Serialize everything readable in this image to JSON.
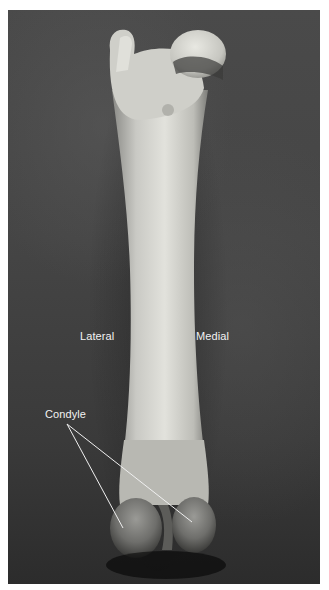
{
  "figure": {
    "background_color": "#424242",
    "label_color": "#f2f2f2",
    "labels": {
      "lateral": "Lateral",
      "medial": "Medial",
      "condyle": "Condyle"
    }
  }
}
